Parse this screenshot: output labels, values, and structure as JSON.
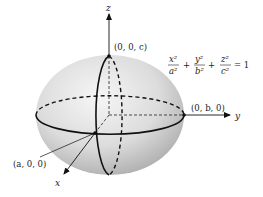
{
  "figure": {
    "type": "ellipsoid-diagram",
    "axes": {
      "x_label": "x",
      "y_label": "y",
      "z_label": "z"
    },
    "points": {
      "top": "(0, 0, c)",
      "right": "(0, b, 0)",
      "front": "(a, 0, 0)"
    },
    "equation": {
      "term1_num": "x²",
      "term1_den": "a²",
      "term2_num": "y²",
      "term2_den": "b²",
      "term3_num": "z²",
      "term3_den": "c²",
      "plus": "+",
      "equals": "= 1"
    },
    "colors": {
      "surface_light": "#f4f4f4",
      "surface_dark": "#a9a9a9",
      "stroke": "#111111"
    }
  }
}
